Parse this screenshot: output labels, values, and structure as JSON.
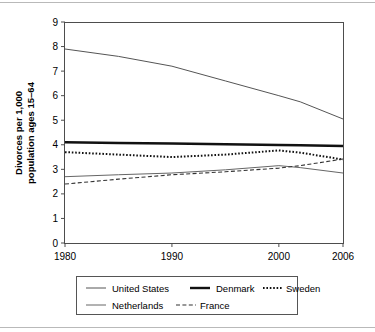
{
  "figure": {
    "background": "#ffffff",
    "frame_color": "#4d4d4d",
    "rule_color": "#b9b9b9"
  },
  "chart_data": {
    "type": "line",
    "title": "",
    "xlabel": "",
    "ylabel": "Divorces per 1,000 population ages 15–64",
    "ylabel_line1": "Divorces per 1,000",
    "ylabel_line2": "population ages 15–64",
    "xlim": [
      1980,
      2006
    ],
    "ylim": [
      0,
      9
    ],
    "xticks": [
      1980,
      1990,
      2000,
      2006
    ],
    "xtick_labels": [
      "1980",
      "1990",
      "2000",
      "2006"
    ],
    "yticks": [
      0,
      1,
      2,
      3,
      4,
      5,
      6,
      7,
      8,
      9
    ],
    "ytick_labels": [
      "0",
      "1",
      "2",
      "3",
      "4",
      "5",
      "6",
      "7",
      "8",
      "9"
    ],
    "grid": false,
    "legend_position": "below-plot",
    "x": [
      1980,
      1985,
      1990,
      1995,
      2000,
      2002,
      2006
    ],
    "series": [
      {
        "name": "United States",
        "style": "solid-thin",
        "color": "#555555",
        "width": 1.0,
        "dash": "",
        "values": [
          7.9,
          7.6,
          7.2,
          6.6,
          6.0,
          5.75,
          5.05
        ]
      },
      {
        "name": "Denmark",
        "style": "solid-thick",
        "color": "#111111",
        "width": 2.4,
        "dash": "",
        "values": [
          4.1,
          4.07,
          4.05,
          4.02,
          3.99,
          3.98,
          3.95
        ]
      },
      {
        "name": "Sweden",
        "style": "dotted",
        "color": "#111111",
        "width": 2.0,
        "dash": "1.6,1.8",
        "values": [
          3.7,
          3.6,
          3.5,
          3.6,
          3.77,
          3.68,
          3.4
        ]
      },
      {
        "name": "Netherlands",
        "style": "solid-thin",
        "color": "#666666",
        "width": 1.0,
        "dash": "",
        "values": [
          2.7,
          2.78,
          2.85,
          2.98,
          3.15,
          3.07,
          2.85
        ]
      },
      {
        "name": "France",
        "style": "dashed",
        "color": "#333333",
        "width": 1.1,
        "dash": "4,2.4",
        "values": [
          2.4,
          2.6,
          2.78,
          2.9,
          3.05,
          3.15,
          3.42
        ]
      }
    ],
    "legend_entries": [
      {
        "label": "United States",
        "style": "solid-thin"
      },
      {
        "label": "Denmark",
        "style": "solid-thick"
      },
      {
        "label": "Sweden",
        "style": "dotted"
      },
      {
        "label": "Netherlands",
        "style": "solid-thin"
      },
      {
        "label": "France",
        "style": "dashed"
      }
    ]
  }
}
